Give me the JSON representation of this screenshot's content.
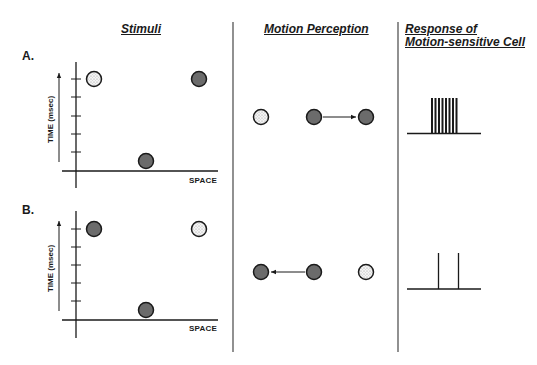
{
  "headers": {
    "stimuli": "Stimuli",
    "motion_perception": "Motion Perception",
    "response_line1": "Response of",
    "response_line2": "Motion-sensitive Cell"
  },
  "panels": [
    {
      "label": "A.",
      "y_axis_label": "TIME (msec)",
      "x_axis_label": "SPACE",
      "stimuli": [
        {
          "type": "stippled",
          "x": 94,
          "y": 79
        },
        {
          "type": "dark",
          "x": 199,
          "y": 79
        },
        {
          "type": "dark",
          "x": 146,
          "y": 161
        }
      ],
      "perception": {
        "dots": [
          "stippled",
          "dark",
          "dark"
        ],
        "arrow_direction": "right"
      },
      "response": {
        "pattern": "burst",
        "spike_count": 8
      }
    },
    {
      "label": "B.",
      "y_axis_label": "TIME (msec)",
      "x_axis_label": "SPACE",
      "stimuli": [
        {
          "type": "dark",
          "x": 94,
          "y": 229
        },
        {
          "type": "stippled",
          "x": 199,
          "y": 229
        },
        {
          "type": "dark",
          "x": 146,
          "y": 310
        }
      ],
      "perception": {
        "dots": [
          "dark",
          "dark",
          "stippled"
        ],
        "arrow_direction": "left"
      },
      "response": {
        "pattern": "sparse",
        "spike_count": 2
      }
    }
  ],
  "colors": {
    "ink": "#1a1a1a",
    "dark_fill": "#6b6b6b",
    "stipple_fill": "#f2f2f2",
    "divider": "#555555"
  }
}
